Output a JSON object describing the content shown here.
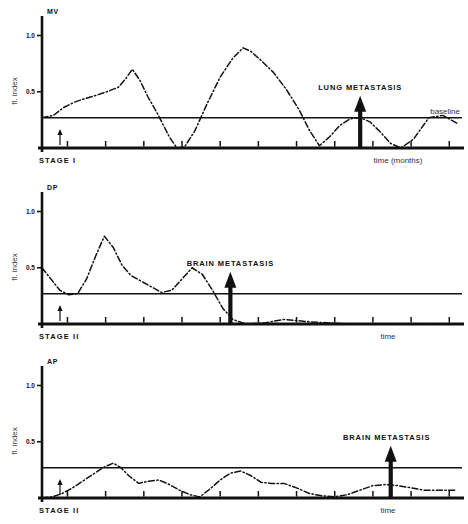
{
  "figure": {
    "name": "fluorescence-index-time-series",
    "line_style": "dash-dot",
    "ink_color": "#111111",
    "panel_count": 3
  },
  "chart_data": [
    {
      "type": "line",
      "title": "MV",
      "xlabel": "time (months)",
      "ylabel": "fl. index",
      "stage_label": "STAGE I",
      "baseline_label": "baseline",
      "baseline_value": 0.27,
      "annotation": "LUNG METASTASIS",
      "annotation_x": 25.0,
      "ylim": [
        0,
        1.12
      ],
      "xlim": [
        0,
        33
      ],
      "yticks": [
        0.5,
        1.0
      ],
      "ytick_labels": [
        "0.5",
        "1.0"
      ],
      "xticks": [
        2,
        5,
        8,
        11,
        14,
        17,
        20,
        23,
        26,
        29,
        32
      ],
      "grid": false,
      "legend": "none",
      "x": [
        0.0,
        0.9,
        1.7,
        2.6,
        3.4,
        4.3,
        5.1,
        6.0,
        6.6,
        7.1,
        7.7,
        8.3,
        9.1,
        10.0,
        10.6,
        11.2,
        12.0,
        13.0,
        14.0,
        15.0,
        15.8,
        16.4,
        17.2,
        18.2,
        19.2,
        20.2,
        21.0,
        21.8,
        22.6,
        23.4,
        24.2,
        25.0,
        25.8,
        26.6,
        27.4,
        28.2,
        29.2,
        30.4,
        31.5,
        32.6
      ],
      "y": [
        0.27,
        0.29,
        0.36,
        0.41,
        0.44,
        0.47,
        0.5,
        0.54,
        0.62,
        0.7,
        0.6,
        0.46,
        0.3,
        0.1,
        0.0,
        0.01,
        0.15,
        0.4,
        0.63,
        0.8,
        0.89,
        0.86,
        0.78,
        0.67,
        0.52,
        0.34,
        0.16,
        0.02,
        0.1,
        0.2,
        0.26,
        0.27,
        0.23,
        0.14,
        0.04,
        0.0,
        0.08,
        0.27,
        0.29,
        0.22
      ]
    },
    {
      "type": "line",
      "title": "DP",
      "xlabel": "time",
      "ylabel": "fl. index",
      "stage_label": "STAGE II",
      "annotation": "BRAIN METASTASIS",
      "annotation_x": 14.8,
      "baseline_value": 0.27,
      "ylim": [
        0,
        1.12
      ],
      "xlim": [
        0,
        33
      ],
      "yticks": [
        0.5,
        1.0
      ],
      "ytick_labels": [
        "0.5",
        "1.0"
      ],
      "xticks": [
        2,
        5,
        8,
        11,
        14,
        17,
        20,
        23,
        26,
        29,
        32
      ],
      "grid": false,
      "legend": "none",
      "x": [
        0.0,
        0.7,
        1.4,
        2.1,
        2.8,
        3.5,
        4.2,
        4.9,
        5.6,
        6.3,
        7.0,
        7.8,
        8.6,
        9.4,
        10.2,
        11.0,
        11.8,
        12.6,
        13.4,
        14.2,
        15.0,
        16.0,
        17.5,
        19.0,
        21.0,
        24.0,
        27.0,
        30.0,
        32.6
      ],
      "y": [
        0.5,
        0.4,
        0.3,
        0.26,
        0.27,
        0.4,
        0.6,
        0.78,
        0.68,
        0.52,
        0.43,
        0.38,
        0.33,
        0.28,
        0.3,
        0.4,
        0.5,
        0.44,
        0.3,
        0.14,
        0.04,
        0.0,
        0.01,
        0.04,
        0.02,
        0.0,
        0.0,
        0.0,
        0.0
      ]
    },
    {
      "type": "line",
      "title": "AP",
      "xlabel": "time",
      "ylabel": "fl. index",
      "stage_label": "STAGE II",
      "annotation": "BRAIN METASTASIS",
      "annotation_x": 27.4,
      "baseline_value": 0.27,
      "ylim": [
        0,
        1.12
      ],
      "xlim": [
        0,
        33
      ],
      "yticks": [
        0.5,
        1.0
      ],
      "ytick_labels": [
        "0.5",
        "1.0"
      ],
      "xticks": [
        2,
        5,
        8,
        11,
        14,
        17,
        20,
        23,
        26,
        29,
        32
      ],
      "grid": false,
      "legend": "none",
      "x": [
        0.0,
        0.8,
        1.6,
        2.4,
        3.2,
        4.0,
        4.8,
        5.6,
        6.2,
        6.8,
        7.6,
        8.4,
        9.2,
        10.0,
        10.8,
        11.6,
        12.4,
        13.2,
        14.0,
        14.8,
        15.6,
        16.4,
        17.2,
        18.0,
        19.0,
        20.0,
        21.0,
        22.0,
        23.0,
        24.0,
        25.0,
        26.0,
        27.0,
        28.0,
        29.0,
        30.0,
        31.2,
        32.6
      ],
      "y": [
        0.0,
        0.01,
        0.04,
        0.09,
        0.15,
        0.21,
        0.27,
        0.31,
        0.27,
        0.2,
        0.13,
        0.15,
        0.16,
        0.12,
        0.07,
        0.03,
        0.01,
        0.08,
        0.16,
        0.22,
        0.24,
        0.2,
        0.14,
        0.13,
        0.13,
        0.09,
        0.04,
        0.02,
        0.01,
        0.03,
        0.07,
        0.11,
        0.12,
        0.11,
        0.09,
        0.07,
        0.07,
        0.07
      ]
    }
  ]
}
